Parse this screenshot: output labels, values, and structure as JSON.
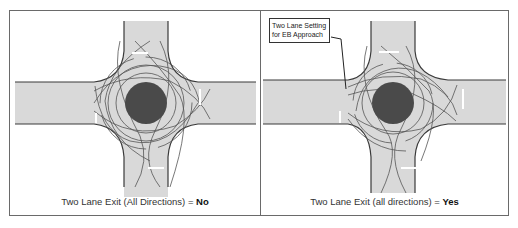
{
  "figure": {
    "panels": [
      {
        "id": "left",
        "caption_prefix": "Two Lane Exit (All Directions) = ",
        "caption_value": "No",
        "callout": null
      },
      {
        "id": "right",
        "caption_prefix": "Two Lane Exit (all directions) = ",
        "caption_value": "Yes",
        "callout": {
          "line1": "Two Lane Setting",
          "line2": "for EB Approach"
        }
      }
    ],
    "colors": {
      "road_fill": "#d9d9d9",
      "road_edge": "#3a3a3a",
      "central_island": "#4a4a4a",
      "path_lines": "#555555",
      "lane_marks": "#ffffff",
      "frame": "#6a6a6a"
    }
  }
}
